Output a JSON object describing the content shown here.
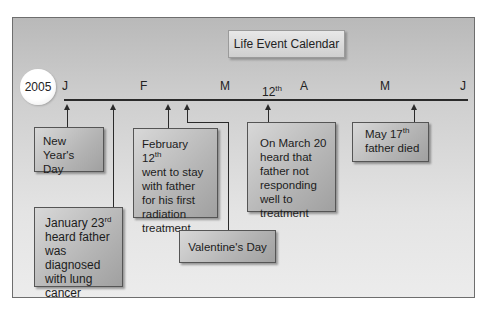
{
  "title": "Life Event Calendar",
  "year": "2005",
  "months": [
    {
      "label": "J",
      "x": 62
    },
    {
      "label": "F",
      "x": 140
    },
    {
      "label": "M",
      "x": 220
    },
    {
      "label": "A",
      "x": 300
    },
    {
      "label": "M",
      "x": 380
    },
    {
      "label": "J",
      "x": 460
    }
  ],
  "marker_12th": {
    "number": "12",
    "suffix": "th"
  },
  "events": {
    "new_years": {
      "line1": "New Year's",
      "line2": "Day"
    },
    "jan23": {
      "date": "January 23",
      "suffix": "rd",
      "text": "heard father was diagnosed with lung cancer"
    },
    "feb12": {
      "date": "February 12",
      "suffix": "th",
      "text": "went to stay with father for his first radiation treatment"
    },
    "valentines": {
      "label": "Valentine's Day"
    },
    "mar20": {
      "text": "On March 20 heard that father not responding well to treatment"
    },
    "may17": {
      "date": "May 17",
      "suffix": "th",
      "text": "father died"
    }
  },
  "colors": {
    "axis": "#2a2a2a",
    "panel_top": "#b9b9b9",
    "panel_bottom": "#ececec",
    "box_light": "#d8d8d8",
    "box_dark": "#a0a0a0"
  }
}
